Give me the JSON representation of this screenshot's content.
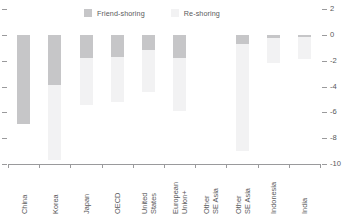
{
  "chart_data": {
    "type": "bar",
    "title": "",
    "subtitle": "",
    "xlabel": "",
    "ylabel": "",
    "ylim": [
      -10,
      2
    ],
    "yticks": [
      2,
      0,
      -2,
      -4,
      -6,
      -8,
      -10
    ],
    "ytick_labels": [
      "2",
      "0",
      "-2",
      "-4",
      "-6",
      "-8",
      "-10"
    ],
    "y_axis_position": "right",
    "grid": false,
    "stacked": false,
    "orientation": "vertical",
    "legend_position": "top",
    "categories": [
      "China",
      "Korea",
      "Japan",
      "OECD",
      "United States",
      "European Union+",
      "Other SE Asia",
      "Other SE Asia",
      "Indonesia",
      "India"
    ],
    "category_lines": [
      [
        "China"
      ],
      [
        "Korea"
      ],
      [
        "Japan"
      ],
      [
        "OECD"
      ],
      [
        "United",
        "States"
      ],
      [
        "European",
        "Union+"
      ],
      [
        "Other",
        "SE Asia"
      ],
      [
        "Other",
        "SE Asia"
      ],
      [
        "Indonesia"
      ],
      [
        "India"
      ]
    ],
    "series": [
      {
        "name": "Friend-shoring",
        "color": "#c6c6c8",
        "values": [
          -6.9,
          -3.9,
          -1.8,
          -1.7,
          -1.2,
          -1.8,
          0.0,
          -0.7,
          -0.25,
          -0.2
        ]
      },
      {
        "name": "Re-shoring",
        "color": "#f2f2f3",
        "values": [
          0.0,
          -9.7,
          -5.4,
          -5.2,
          -4.4,
          -5.9,
          0.0,
          -9.0,
          -2.2,
          -1.9
        ]
      }
    ]
  },
  "legend": {
    "entries": [
      {
        "label": "Friend-shoring",
        "color": "#c6c6c8"
      },
      {
        "label": "Re-shoring",
        "color": "#f2f2f3"
      }
    ]
  },
  "axis": {
    "right_labels": [
      "2",
      "0",
      "-2",
      "-4",
      "-6",
      "-8",
      "-10"
    ]
  }
}
